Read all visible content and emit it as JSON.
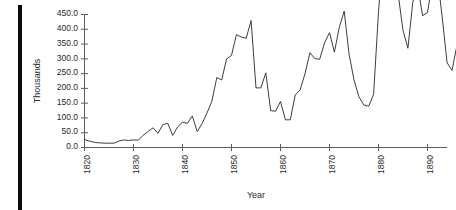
{
  "chart_data": {
    "type": "line",
    "title": "",
    "xlabel": "Year",
    "ylabel": "Thousands",
    "xlim": [
      1820,
      1896
    ],
    "ylim": [
      0,
      450
    ],
    "grid": false,
    "legend": false,
    "xticks": [
      1820,
      1830,
      1840,
      1850,
      1860,
      1870,
      1880,
      1890
    ],
    "xtick_labels": [
      "1820",
      "1830",
      "1840",
      "1850",
      "1860",
      "1870",
      "1880",
      "1890"
    ],
    "yticks": [
      0,
      50,
      100,
      150,
      200,
      250,
      300,
      350,
      400,
      450
    ],
    "ytick_labels": [
      "0.0",
      "50.0",
      "100.0",
      "150.0",
      "200.0",
      "250.0",
      "300.0",
      "350.0",
      "400.0",
      "450.0"
    ],
    "series": [
      {
        "name": "Immigration",
        "x": [
          1820,
          1821,
          1822,
          1823,
          1824,
          1825,
          1826,
          1827,
          1828,
          1829,
          1830,
          1831,
          1832,
          1833,
          1834,
          1835,
          1836,
          1837,
          1838,
          1839,
          1840,
          1841,
          1842,
          1843,
          1844,
          1845,
          1846,
          1847,
          1848,
          1849,
          1850,
          1851,
          1852,
          1853,
          1854,
          1855,
          1856,
          1857,
          1858,
          1859,
          1860,
          1861,
          1862,
          1863,
          1864,
          1865,
          1866,
          1867,
          1868,
          1869,
          1870,
          1871,
          1872,
          1873,
          1874,
          1875,
          1876,
          1877,
          1878,
          1879,
          1880,
          1881,
          1882,
          1883,
          1884,
          1885,
          1886,
          1887,
          1888,
          1889,
          1890,
          1891,
          1892,
          1893,
          1894,
          1895,
          1896
        ],
        "values": [
          25,
          20,
          16,
          14,
          13,
          13,
          13,
          20,
          24,
          22,
          24,
          23,
          40,
          53,
          65,
          46,
          76,
          80,
          39,
          68,
          84,
          80,
          105,
          52,
          79,
          115,
          155,
          235,
          227,
          298,
          310,
          380,
          372,
          368,
          428,
          200,
          200,
          251,
          123,
          121,
          154,
          92,
          92,
          176,
          193,
          248,
          319,
          299,
          297,
          353,
          387,
          321,
          405,
          460,
          313,
          227,
          170,
          142,
          138,
          178,
          457,
          669,
          789,
          603,
          519,
          395,
          334,
          490,
          546,
          444,
          455,
          560,
          580,
          440,
          285,
          259,
          343
        ],
        "note": "values plotted in thousands as read from the vertical axis"
      }
    ]
  },
  "axes": {
    "y_axis_title": "Thousands",
    "x_axis_title": "Year"
  },
  "figure": {
    "background_color": "#ffffff",
    "line_color": "#3d3d3d",
    "axis_color": "#5b5b5b",
    "text_color": "#2a2a2a"
  }
}
